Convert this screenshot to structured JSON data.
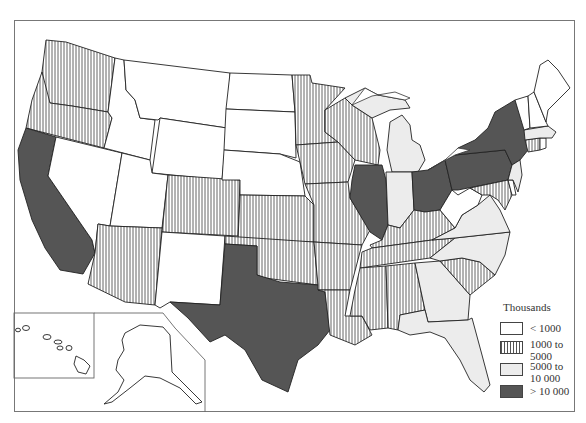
{
  "map": {
    "subject": "United States by state, shaded by value (thousands)",
    "fills": {
      "lt_1000": "#ffffff",
      "1000_to_5000": "hatched",
      "5000_to_10000": "#ececec",
      "gt_10000": "#555555"
    },
    "states": {
      "gt_10000": [
        "California",
        "Texas",
        "Illinois",
        "Ohio",
        "Pennsylvania",
        "New York"
      ],
      "5000_to_10000": [
        "Michigan",
        "Indiana",
        "Massachusetts",
        "New Jersey",
        "Virginia",
        "North Carolina",
        "Georgia",
        "Florida"
      ],
      "1000_to_5000": [
        "Washington",
        "Oregon",
        "Arizona",
        "Colorado",
        "Minnesota",
        "Iowa",
        "Missouri",
        "Kansas",
        "Oklahoma",
        "Arkansas",
        "Louisiana",
        "Mississippi",
        "Alabama",
        "Tennessee",
        "Kentucky",
        "South Carolina",
        "Wisconsin",
        "Maryland",
        "Connecticut"
      ],
      "lt_1000": [
        "Nevada",
        "Idaho",
        "Montana",
        "Wyoming",
        "Utah",
        "New Mexico",
        "North Dakota",
        "South Dakota",
        "Nebraska",
        "West Virginia",
        "Maine",
        "New Hampshire",
        "Vermont",
        "Delaware",
        "Rhode Island",
        "Alaska",
        "Hawaii"
      ]
    }
  },
  "legend": {
    "title": "Thousands",
    "items": [
      {
        "label": "< 1000",
        "fill": "#ffffff"
      },
      {
        "label_line1": "1000 to",
        "label_line2": "5000",
        "fill": "hatched"
      },
      {
        "label_line1": "5000 to",
        "label_line2": "10 000",
        "fill": "#ececec"
      },
      {
        "label": "> 10 000",
        "fill": "#555555"
      }
    ]
  }
}
